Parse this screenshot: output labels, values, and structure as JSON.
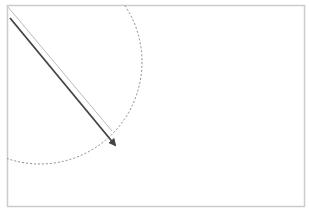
{
  "diagram": {
    "frame": {
      "x": 7,
      "y": 5,
      "width": 298,
      "height": 202,
      "color": "#cccccc"
    },
    "circle": {
      "cx": 40,
      "cy": 62,
      "r": 102,
      "color": "#888888",
      "style": "dotted"
    },
    "guide_line": {
      "x1": 8,
      "y1": 7,
      "x2": 112,
      "y2": 131,
      "color": "#bbbbbb"
    },
    "arrow": {
      "x1": 10,
      "y1": 18,
      "x2": 115,
      "y2": 145,
      "color": "#444444"
    }
  }
}
